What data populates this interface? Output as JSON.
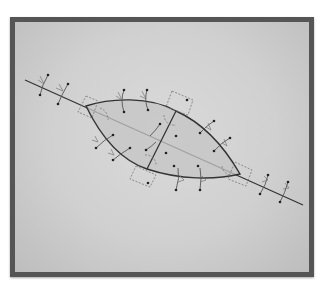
{
  "figure": {
    "frame": {
      "border_color": "#555555",
      "fill_light": "#dadada",
      "fill_dark": "#bdbdbd"
    },
    "lens": {
      "fill": "#c4c4c4",
      "stroke": "#333333"
    },
    "colors": {
      "line": "#333333",
      "dashed": "#777777",
      "mark": "#555555",
      "dot": "#222222"
    }
  }
}
